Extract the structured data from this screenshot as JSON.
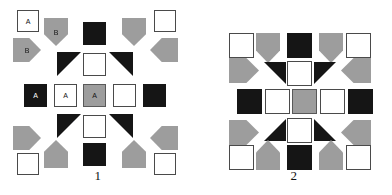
{
  "colors": {
    "white": "#ffffff",
    "gray": "#9d9d9d",
    "black": "#151515",
    "outline": "#4a4a4a",
    "background": "#ffffff"
  },
  "figures": [
    {
      "id": "figure-1",
      "caption": "1",
      "shapes": [
        {
          "name": "square-white-a-top-left",
          "kind": "square",
          "fill": "white",
          "x": 17,
          "y": 10,
          "w": 22,
          "h": 22,
          "label": "A",
          "label_color": "dark"
        },
        {
          "name": "pentagon-gray-b-down-top",
          "kind": "pentagon",
          "dir": "down",
          "fill": "gray",
          "x": 44,
          "y": 18,
          "w": 24,
          "h": 28,
          "label": "B",
          "label_color": "dark"
        },
        {
          "name": "square-black-top-center",
          "kind": "square",
          "fill": "black",
          "x": 83,
          "y": 22,
          "w": 23,
          "h": 23,
          "label": "",
          "label_color": "light"
        },
        {
          "name": "pentagon-gray-down-top-right",
          "kind": "pentagon",
          "dir": "down",
          "fill": "gray",
          "x": 122,
          "y": 18,
          "w": 24,
          "h": 28,
          "label": "",
          "label_color": "dark"
        },
        {
          "name": "square-white-top-right",
          "kind": "square",
          "fill": "white",
          "x": 154,
          "y": 10,
          "w": 22,
          "h": 22,
          "label": "",
          "label_color": "dark"
        },
        {
          "name": "pentagon-gray-b-right",
          "kind": "pentagon",
          "dir": "right",
          "fill": "gray",
          "x": 13,
          "y": 38,
          "w": 28,
          "h": 24,
          "label": "B",
          "label_color": "dark"
        },
        {
          "name": "pentagon-gray-left-upper",
          "kind": "pentagon",
          "dir": "left",
          "fill": "gray",
          "x": 150,
          "y": 38,
          "w": 28,
          "h": 24,
          "label": "",
          "label_color": "dark"
        },
        {
          "name": "triangle-black-c-left-upper",
          "kind": "triangle",
          "dir": "tl",
          "fill": "black",
          "x": 57,
          "y": 52,
          "w": 24,
          "h": 24,
          "label": "C",
          "label_color": "light"
        },
        {
          "name": "square-white-upper-center",
          "kind": "square",
          "fill": "white",
          "x": 83,
          "y": 53,
          "w": 23,
          "h": 23,
          "label": "",
          "label_color": "dark"
        },
        {
          "name": "triangle-black-right-upper",
          "kind": "triangle",
          "dir": "tr",
          "fill": "black",
          "x": 109,
          "y": 52,
          "w": 24,
          "h": 24,
          "label": "",
          "label_color": "light"
        },
        {
          "name": "square-black-a-mid-left",
          "kind": "square",
          "fill": "black",
          "x": 24,
          "y": 84,
          "w": 23,
          "h": 23,
          "label": "A",
          "label_color": "light"
        },
        {
          "name": "square-white-a-mid-left2",
          "kind": "square",
          "fill": "white",
          "x": 54,
          "y": 84,
          "w": 23,
          "h": 23,
          "label": "A",
          "label_color": "dark"
        },
        {
          "name": "square-gray-a-center",
          "kind": "square",
          "fill": "gray",
          "x": 83,
          "y": 84,
          "w": 23,
          "h": 23,
          "label": "A",
          "label_color": "dark"
        },
        {
          "name": "square-white-mid-right",
          "kind": "square",
          "fill": "white",
          "x": 113,
          "y": 84,
          "w": 23,
          "h": 23,
          "label": "",
          "label_color": "dark"
        },
        {
          "name": "square-black-mid-right2",
          "kind": "square",
          "fill": "black",
          "x": 143,
          "y": 84,
          "w": 23,
          "h": 23,
          "label": "",
          "label_color": "light"
        },
        {
          "name": "triangle-black-c-left-lower",
          "kind": "triangle",
          "dir": "tl",
          "fill": "black",
          "x": 57,
          "y": 114,
          "w": 24,
          "h": 24,
          "label": "C",
          "label_color": "light"
        },
        {
          "name": "square-white-lower-center",
          "kind": "square",
          "fill": "white",
          "x": 83,
          "y": 115,
          "w": 23,
          "h": 23,
          "label": "",
          "label_color": "dark"
        },
        {
          "name": "triangle-black-right-lower",
          "kind": "triangle",
          "dir": "tr",
          "fill": "black",
          "x": 109,
          "y": 114,
          "w": 24,
          "h": 24,
          "label": "",
          "label_color": "light"
        },
        {
          "name": "pentagon-gray-right-lower",
          "kind": "pentagon",
          "dir": "right",
          "fill": "gray",
          "x": 13,
          "y": 126,
          "w": 28,
          "h": 24,
          "label": "",
          "label_color": "dark"
        },
        {
          "name": "pentagon-gray-left-lower",
          "kind": "pentagon",
          "dir": "left",
          "fill": "gray",
          "x": 150,
          "y": 126,
          "w": 28,
          "h": 24,
          "label": "",
          "label_color": "dark"
        },
        {
          "name": "pentagon-gray-up-bottom-left",
          "kind": "pentagon",
          "dir": "up",
          "fill": "gray",
          "x": 44,
          "y": 140,
          "w": 24,
          "h": 28,
          "label": "",
          "label_color": "dark"
        },
        {
          "name": "square-black-bottom-center",
          "kind": "square",
          "fill": "black",
          "x": 83,
          "y": 143,
          "w": 23,
          "h": 23,
          "label": "",
          "label_color": "light"
        },
        {
          "name": "pentagon-gray-up-bottom-right",
          "kind": "pentagon",
          "dir": "up",
          "fill": "gray",
          "x": 122,
          "y": 140,
          "w": 24,
          "h": 28,
          "label": "",
          "label_color": "dark"
        },
        {
          "name": "square-white-bottom-left",
          "kind": "square",
          "fill": "white",
          "x": 17,
          "y": 153,
          "w": 22,
          "h": 22,
          "label": "",
          "label_color": "dark"
        },
        {
          "name": "square-white-bottom-right",
          "kind": "square",
          "fill": "white",
          "x": 154,
          "y": 153,
          "w": 22,
          "h": 22,
          "label": "",
          "label_color": "dark"
        }
      ]
    },
    {
      "id": "figure-2",
      "caption": "2",
      "shapes": [
        {
          "name": "square-white-top-left",
          "kind": "square",
          "fill": "white",
          "x": 33,
          "y": 33,
          "w": 25,
          "h": 25,
          "label": "",
          "label_color": "dark"
        },
        {
          "name": "pentagon-gray-down-top-left",
          "kind": "pentagon",
          "dir": "down",
          "fill": "gray",
          "x": 60,
          "y": 33,
          "w": 24,
          "h": 30,
          "label": "",
          "label_color": "dark"
        },
        {
          "name": "square-black-top-center",
          "kind": "square",
          "fill": "black",
          "x": 91,
          "y": 33,
          "w": 25,
          "h": 25,
          "label": "",
          "label_color": "light"
        },
        {
          "name": "pentagon-gray-down-top-right",
          "kind": "pentagon",
          "dir": "down",
          "fill": "gray",
          "x": 123,
          "y": 33,
          "w": 24,
          "h": 30,
          "label": "",
          "label_color": "dark"
        },
        {
          "name": "square-white-top-right",
          "kind": "square",
          "fill": "white",
          "x": 150,
          "y": 33,
          "w": 25,
          "h": 25,
          "label": "",
          "label_color": "dark"
        },
        {
          "name": "pentagon-gray-right-upper",
          "kind": "pentagon",
          "dir": "right",
          "fill": "gray",
          "x": 33,
          "y": 58,
          "w": 30,
          "h": 25,
          "label": "",
          "label_color": "dark"
        },
        {
          "name": "pentagon-gray-left-upper",
          "kind": "pentagon",
          "dir": "left",
          "fill": "gray",
          "x": 145,
          "y": 58,
          "w": 30,
          "h": 25,
          "label": "",
          "label_color": "dark"
        },
        {
          "name": "triangle-black-left-upper",
          "kind": "triangle",
          "dir": "tr",
          "fill": "black",
          "x": 68,
          "y": 62,
          "w": 22,
          "h": 22,
          "label": "",
          "label_color": "light"
        },
        {
          "name": "square-white-upper-center",
          "kind": "square",
          "fill": "white",
          "x": 91,
          "y": 61,
          "w": 25,
          "h": 25,
          "label": "",
          "label_color": "dark"
        },
        {
          "name": "triangle-black-right-upper",
          "kind": "triangle",
          "dir": "tl",
          "fill": "black",
          "x": 118,
          "y": 62,
          "w": 22,
          "h": 22,
          "label": "",
          "label_color": "light"
        },
        {
          "name": "square-black-mid-left",
          "kind": "square",
          "fill": "black",
          "x": 41,
          "y": 89,
          "w": 25,
          "h": 25,
          "label": "",
          "label_color": "light"
        },
        {
          "name": "square-white-mid-left2",
          "kind": "square",
          "fill": "white",
          "x": 69,
          "y": 89,
          "w": 25,
          "h": 25,
          "label": "",
          "label_color": "dark"
        },
        {
          "name": "square-gray-center",
          "kind": "square",
          "fill": "gray",
          "x": 96,
          "y": 89,
          "w": 25,
          "h": 25,
          "label": "",
          "label_color": "dark"
        },
        {
          "name": "square-white-mid-right",
          "kind": "square",
          "fill": "white",
          "x": 124,
          "y": 89,
          "w": 25,
          "h": 25,
          "label": "",
          "label_color": "dark"
        },
        {
          "name": "square-black-mid-right2",
          "kind": "square",
          "fill": "black",
          "x": 152,
          "y": 89,
          "w": 25,
          "h": 25,
          "label": "",
          "label_color": "light"
        },
        {
          "name": "triangle-black-left-lower",
          "kind": "triangle",
          "dir": "br",
          "fill": "black",
          "x": 68,
          "y": 119,
          "w": 22,
          "h": 22,
          "label": "",
          "label_color": "light"
        },
        {
          "name": "square-white-lower-center",
          "kind": "square",
          "fill": "white",
          "x": 91,
          "y": 118,
          "w": 25,
          "h": 25,
          "label": "",
          "label_color": "dark"
        },
        {
          "name": "triangle-black-right-lower",
          "kind": "triangle",
          "dir": "bl",
          "fill": "black",
          "x": 118,
          "y": 119,
          "w": 22,
          "h": 22,
          "label": "",
          "label_color": "light"
        },
        {
          "name": "pentagon-gray-right-lower",
          "kind": "pentagon",
          "dir": "right",
          "fill": "gray",
          "x": 33,
          "y": 120,
          "w": 30,
          "h": 25,
          "label": "",
          "label_color": "dark"
        },
        {
          "name": "pentagon-gray-left-lower",
          "kind": "pentagon",
          "dir": "left",
          "fill": "gray",
          "x": 145,
          "y": 120,
          "w": 30,
          "h": 25,
          "label": "",
          "label_color": "dark"
        },
        {
          "name": "square-white-bottom-left",
          "kind": "square",
          "fill": "white",
          "x": 33,
          "y": 145,
          "w": 25,
          "h": 25,
          "label": "",
          "label_color": "dark"
        },
        {
          "name": "pentagon-gray-up-bottom-left",
          "kind": "pentagon",
          "dir": "up",
          "fill": "gray",
          "x": 60,
          "y": 140,
          "w": 24,
          "h": 30,
          "label": "",
          "label_color": "dark"
        },
        {
          "name": "square-black-bottom-center",
          "kind": "square",
          "fill": "black",
          "x": 91,
          "y": 145,
          "w": 25,
          "h": 25,
          "label": "",
          "label_color": "light"
        },
        {
          "name": "pentagon-gray-up-bottom-right",
          "kind": "pentagon",
          "dir": "up",
          "fill": "gray",
          "x": 123,
          "y": 140,
          "w": 24,
          "h": 30,
          "label": "",
          "label_color": "dark"
        },
        {
          "name": "square-white-bottom-right",
          "kind": "square",
          "fill": "white",
          "x": 150,
          "y": 145,
          "w": 25,
          "h": 25,
          "label": "",
          "label_color": "dark"
        }
      ]
    }
  ]
}
